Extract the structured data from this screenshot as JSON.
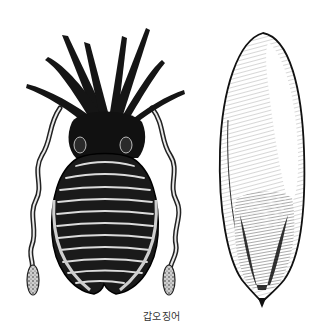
{
  "illustration": {
    "left_figure": "cuttlefish-dorsal-view",
    "right_figure": "cuttlebone",
    "style": "black-and-white engraving",
    "colors": {
      "ink": "#111111",
      "paper": "#ffffff",
      "mid": "#555555"
    }
  },
  "caption": {
    "text": "갑오징어"
  }
}
